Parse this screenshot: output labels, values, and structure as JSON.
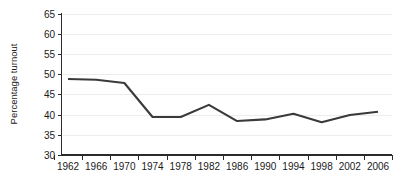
{
  "chart_data": {
    "type": "line",
    "title": "",
    "xlabel": "",
    "ylabel": "Percentage turnout",
    "x": [
      1962,
      1966,
      1970,
      1974,
      1978,
      1982,
      1986,
      1990,
      1994,
      1998,
      2002,
      2006
    ],
    "categories": [
      "1962",
      "1966",
      "1970",
      "1974",
      "1978",
      "1982",
      "1986",
      "1990",
      "1994",
      "1998",
      "2002",
      "2006"
    ],
    "values": [
      48.8,
      48.6,
      47.8,
      39.4,
      39.4,
      42.4,
      38.4,
      38.8,
      40.2,
      38.1,
      39.9,
      40.7
    ],
    "series": [
      {
        "name": "Percentage turnout",
        "color": "#3a3a3a",
        "values": [
          48.8,
          48.6,
          47.8,
          39.4,
          39.4,
          42.4,
          38.4,
          38.8,
          40.2,
          38.1,
          39.9,
          40.7
        ]
      }
    ],
    "ylim": [
      30,
      65
    ],
    "yticks": [
      30,
      35,
      40,
      45,
      50,
      55,
      60,
      65
    ],
    "ytick_labels": [
      "30",
      "35",
      "40",
      "45",
      "50",
      "55",
      "60",
      "65"
    ],
    "xtick_labels": [
      "1962",
      "1966",
      "1970",
      "1974",
      "1978",
      "1982",
      "1986",
      "1990",
      "1994",
      "1998",
      "2002",
      "2006"
    ],
    "grid": true,
    "grid_color": "#ececec",
    "legend": null,
    "background_color": "#ffffff",
    "axis_color": "#2b2b2b"
  }
}
